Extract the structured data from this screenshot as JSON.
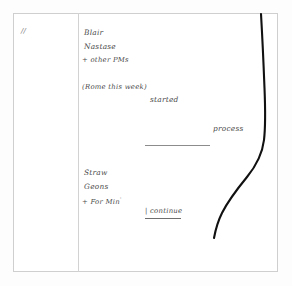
{
  "page": {
    "kind": "handwritten-note-scan",
    "background_color": "#fdfdfd",
    "sheet_color": "#ffffff",
    "frame_color": "#cfcfcf",
    "ink_color": "#4a4a4a",
    "curve_color": "#111111"
  },
  "margin_column": {
    "mark": "//"
  },
  "notes": {
    "upper_list": [
      {
        "id": "blair",
        "text": "Blair"
      },
      {
        "id": "nastase",
        "text": "Nastase"
      },
      {
        "id": "other_pms",
        "text": "+ other PMs"
      }
    ],
    "parenthetical": "(Rome this week)",
    "mid_annotations": [
      {
        "id": "started",
        "text": "started"
      },
      {
        "id": "process",
        "text": "process"
      }
    ],
    "lower_list": [
      {
        "id": "straw",
        "text": "Straw"
      },
      {
        "id": "geons",
        "text": "Geons"
      },
      {
        "id": "for_min",
        "text": "+ For Min",
        "superscript": "'"
      }
    ],
    "continue_note": "| continue"
  }
}
